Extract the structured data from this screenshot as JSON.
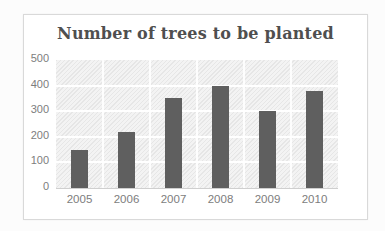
{
  "chart_data": {
    "type": "bar",
    "title": "Number of trees to be planted",
    "categories": [
      "2005",
      "2006",
      "2007",
      "2008",
      "2009",
      "2010"
    ],
    "values": [
      150,
      220,
      350,
      400,
      300,
      380
    ],
    "xlabel": "",
    "ylabel": "",
    "ylim": [
      0,
      500
    ],
    "yticks": [
      0,
      100,
      200,
      300,
      400,
      500
    ],
    "grid": "horizontal",
    "legend": "none",
    "colors": {
      "bar": "#5f5f5f",
      "title_text": "#4f4f4f",
      "axis_text": "#7d7d7d",
      "chart_border": "#d9d9d9",
      "gridline": "#ffffff",
      "plot_background": "#f3f3f3"
    }
  }
}
